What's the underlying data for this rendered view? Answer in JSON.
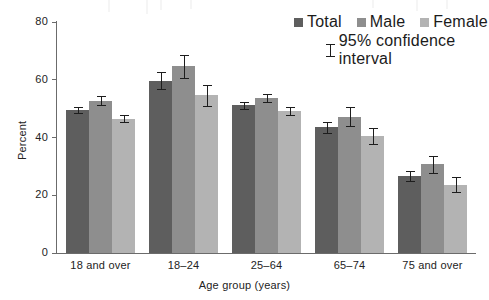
{
  "chart_data": {
    "type": "bar",
    "title": "",
    "xlabel": "Age group (years)",
    "ylabel": "Percent",
    "ylim": [
      0,
      80
    ],
    "yticks": [
      0,
      20,
      40,
      60,
      80
    ],
    "grid": false,
    "legend_position": "top-right",
    "error_bars": "95% confidence interval",
    "categories": [
      "18 and over",
      "18–24",
      "25–64",
      "65–74",
      "75 and over"
    ],
    "series": [
      {
        "name": "Total",
        "color": "#5e5e5e",
        "values": [
          49.6,
          59.7,
          51.2,
          43.5,
          26.6
        ],
        "errors": [
          1.1,
          3.0,
          1.2,
          2.0,
          1.8
        ]
      },
      {
        "name": "Male",
        "color": "#8e8e8e",
        "values": [
          52.8,
          64.6,
          53.6,
          47.2,
          30.7
        ],
        "errors": [
          1.4,
          4.1,
          1.4,
          3.3,
          3.0
        ]
      },
      {
        "name": "Female",
        "color": "#b3b3b3",
        "values": [
          46.5,
          54.6,
          49.1,
          40.5,
          23.6
        ],
        "errors": [
          1.3,
          3.7,
          1.3,
          2.7,
          2.6
        ]
      }
    ]
  },
  "legend": {
    "entries": [
      {
        "label": "Total",
        "key": "total"
      },
      {
        "label": "Male",
        "key": "male"
      },
      {
        "label": "Female",
        "key": "female"
      }
    ],
    "ci_label": "95% confidence interval"
  }
}
